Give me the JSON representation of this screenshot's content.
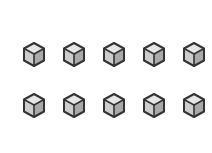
{
  "canvas": {
    "background": "#ffffff"
  },
  "icon": {
    "name": "cube-icon",
    "colors": {
      "top": "#e6e6e6",
      "left": "#cdcdcd",
      "right": "#a9a9a9",
      "outline": "#333333"
    }
  },
  "rows": [
    {
      "items": [
        {
          "name": "cube-1"
        },
        {
          "name": "cube-2"
        },
        {
          "name": "cube-3"
        },
        {
          "name": "cube-4"
        },
        {
          "name": "cube-5"
        }
      ]
    },
    {
      "items": [
        {
          "name": "cube-6"
        },
        {
          "name": "cube-7"
        },
        {
          "name": "cube-8"
        },
        {
          "name": "cube-9"
        },
        {
          "name": "cube-10"
        }
      ]
    }
  ]
}
